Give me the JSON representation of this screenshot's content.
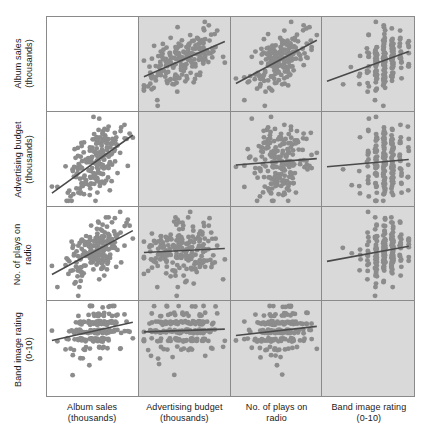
{
  "figure": {
    "type": "scatterplot-matrix",
    "title": "",
    "panel_background_gray": "#d9d9d9",
    "panel_background_white": "#ffffff",
    "point_color": "#8c8c8c",
    "line_color": "#4a4a4a",
    "border_color": "#8a8a8a"
  },
  "variables": [
    {
      "key": "album_sales",
      "line1": "Album sales",
      "line2": "(thousands)"
    },
    {
      "key": "advertising_budget",
      "line1": "Advertising budget",
      "line2": "(thousands)"
    },
    {
      "key": "plays_radio",
      "line1": "No. of plays on",
      "line2": "radio"
    },
    {
      "key": "band_image",
      "line1": "Band image rating",
      "line2": "(0-10)"
    }
  ],
  "row_labels": [
    {
      "line1": "Album sales",
      "line2": "(thousands)"
    },
    {
      "line1": "Advertising budget",
      "line2": "(thousands)"
    },
    {
      "line1": "No. of plays on",
      "line2": "radio"
    },
    {
      "line1": "Band image rating",
      "line2": "(0-10)"
    }
  ],
  "column_labels": [
    {
      "line1": "Album sales",
      "line2": "(thousands)"
    },
    {
      "line1": "Advertising budget",
      "line2": "(thousands)"
    },
    {
      "line1": "No. of plays on",
      "line2": "radio"
    },
    {
      "line1": "Band image rating",
      "line2": "(0-10)"
    }
  ],
  "chart_data": {
    "type": "scatter",
    "layout": "4x4 scatterplot matrix, diagonal cells empty, lower-left column 1 panels white, all other panels light gray",
    "title": "",
    "xlabel": "",
    "ylabel": "",
    "grid": false,
    "legend": "none",
    "variables": [
      "Album sales (thousands)",
      "Advertising budget (thousands)",
      "No. of plays on radio",
      "Band image rating (0-10)"
    ],
    "n_points": 200,
    "axis_ranges": {
      "album_sales": [
        0,
        360
      ],
      "advertising_budget": [
        0,
        2300
      ],
      "plays_radio": [
        0,
        60
      ],
      "band_image": [
        0,
        10
      ]
    },
    "correlations": {
      "album_sales__advertising_budget": 0.58,
      "album_sales__plays_radio": 0.6,
      "album_sales__band_image": 0.33,
      "advertising_budget__plays_radio": 0.1,
      "advertising_budget__band_image": 0.08,
      "plays_radio__band_image": 0.18
    },
    "panels": [
      {
        "row": 0,
        "col": 0,
        "empty": true,
        "x": "album_sales",
        "y": "album_sales"
      },
      {
        "row": 0,
        "col": 1,
        "empty": false,
        "x": "advertising_budget",
        "y": "album_sales",
        "background": "gray",
        "slope": "positive",
        "r": 0.58
      },
      {
        "row": 0,
        "col": 2,
        "empty": false,
        "x": "plays_radio",
        "y": "album_sales",
        "background": "gray",
        "slope": "positive",
        "r": 0.6
      },
      {
        "row": 0,
        "col": 3,
        "empty": false,
        "x": "band_image",
        "y": "album_sales",
        "background": "gray",
        "slope": "positive",
        "r": 0.33,
        "discrete_x": true
      },
      {
        "row": 1,
        "col": 0,
        "empty": false,
        "x": "album_sales",
        "y": "advertising_budget",
        "background": "white",
        "slope": "positive",
        "r": 0.58
      },
      {
        "row": 1,
        "col": 1,
        "empty": true,
        "x": "advertising_budget",
        "y": "advertising_budget"
      },
      {
        "row": 1,
        "col": 2,
        "empty": false,
        "x": "plays_radio",
        "y": "advertising_budget",
        "background": "gray",
        "slope": "positive",
        "r": 0.1
      },
      {
        "row": 1,
        "col": 3,
        "empty": false,
        "x": "band_image",
        "y": "advertising_budget",
        "background": "gray",
        "slope": "positive",
        "r": 0.08,
        "discrete_x": true
      },
      {
        "row": 2,
        "col": 0,
        "empty": false,
        "x": "album_sales",
        "y": "plays_radio",
        "background": "white",
        "slope": "positive",
        "r": 0.6
      },
      {
        "row": 2,
        "col": 1,
        "empty": false,
        "x": "advertising_budget",
        "y": "plays_radio",
        "background": "gray",
        "slope": "positive",
        "r": 0.1
      },
      {
        "row": 2,
        "col": 2,
        "empty": true,
        "x": "plays_radio",
        "y": "plays_radio"
      },
      {
        "row": 2,
        "col": 3,
        "empty": false,
        "x": "band_image",
        "y": "plays_radio",
        "background": "gray",
        "slope": "positive",
        "r": 0.18,
        "discrete_x": true
      },
      {
        "row": 3,
        "col": 0,
        "empty": false,
        "x": "album_sales",
        "y": "band_image",
        "background": "white",
        "slope": "positive",
        "r": 0.33,
        "discrete_y": true
      },
      {
        "row": 3,
        "col": 1,
        "empty": false,
        "x": "advertising_budget",
        "y": "band_image",
        "background": "gray",
        "slope": "positive",
        "r": 0.08,
        "discrete_y": true
      },
      {
        "row": 3,
        "col": 2,
        "empty": false,
        "x": "plays_radio",
        "y": "band_image",
        "background": "gray",
        "slope": "positive",
        "r": 0.18,
        "discrete_y": true
      },
      {
        "row": 3,
        "col": 3,
        "empty": true,
        "x": "band_image",
        "y": "band_image"
      }
    ]
  }
}
